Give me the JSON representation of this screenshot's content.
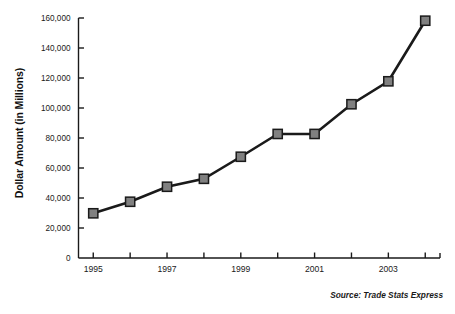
{
  "chart_data": {
    "type": "line",
    "title": "",
    "xlabel": "",
    "ylabel": "Dollar Amount (in Millions)",
    "x": [
      1995,
      1996,
      1997,
      1998,
      1999,
      2000,
      2001,
      2002,
      2003,
      2004
    ],
    "values": [
      29800,
      37500,
      47500,
      52800,
      67500,
      82700,
      82700,
      102500,
      117800,
      158200
    ],
    "categories": [
      "1995",
      "1996",
      "1997",
      "1998",
      "1999",
      "2000",
      "2001",
      "2002",
      "2003",
      "2004"
    ],
    "xtick_labels": [
      "1995",
      "",
      "1997",
      "",
      "1999",
      "",
      "2001",
      "",
      "2003",
      ""
    ],
    "ytick_labels": [
      "0",
      "20,000",
      "40,000",
      "60,000",
      "80,000",
      "100,000",
      "120,000",
      "140,000",
      "160,000"
    ],
    "ytick_values": [
      0,
      20000,
      40000,
      60000,
      80000,
      100000,
      120000,
      140000,
      160000
    ],
    "ylim": [
      0,
      160000
    ],
    "xlim": [
      1994.6,
      2004.4
    ],
    "grid": false,
    "legend": null,
    "series_color": "#808080",
    "line_color": "#1a1a1a",
    "marker": "square",
    "annotation": "Source: Trade Stats Express"
  },
  "axis": {
    "y_title": "Dollar Amount (in Millions)"
  },
  "footer": {
    "source": "Source: Trade Stats Express"
  }
}
